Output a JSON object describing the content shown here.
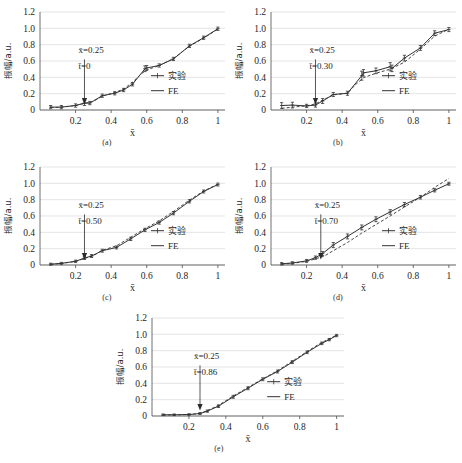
{
  "figure": {
    "panel_captions": [
      "(a)",
      "(b)",
      "(c)",
      "(d)",
      "(e)"
    ],
    "legend": {
      "experiment_label": "实验",
      "fe_label": "FE"
    },
    "axis": {
      "xlabel": "x̄",
      "ylabel": "振幅/a.u.",
      "xticks": [
        "0.2",
        "0.4",
        "0.6",
        "0.8",
        "1"
      ],
      "yticks": [
        "0",
        "0.2",
        "0.4",
        "0.6",
        "0.8",
        "1.0",
        "1.2"
      ]
    },
    "annotation_x": "x̄=0.25"
  },
  "chart_data": [
    {
      "type": "line",
      "panel": "(a)",
      "title": "",
      "xlabel": "x̄",
      "ylabel": "振幅/a.u.",
      "xlim": [
        0.0,
        1.04
      ],
      "ylim": [
        0.0,
        1.2
      ],
      "grid": true,
      "legend_position": "right-middle",
      "annotations": [
        "x̄=0.25",
        "t̄=0"
      ],
      "arrow_at_x": 0.25,
      "series": [
        {
          "name": "实验",
          "style": "solid-with-markers",
          "x": [
            0.06,
            0.12,
            0.2,
            0.25,
            0.28,
            0.35,
            0.42,
            0.47,
            0.52,
            0.59,
            0.6,
            0.67,
            0.75,
            0.84,
            0.92,
            1.0
          ],
          "y": [
            0.035,
            0.035,
            0.055,
            0.085,
            0.085,
            0.175,
            0.205,
            0.245,
            0.315,
            0.505,
            0.515,
            0.545,
            0.625,
            0.785,
            0.885,
            0.995
          ],
          "yerr": [
            0.02,
            0.02,
            0.02,
            0.03,
            0.02,
            0.02,
            0.02,
            0.02,
            0.02,
            0.035,
            0.03,
            0.02,
            0.02,
            0.02,
            0.02,
            0.02
          ]
        },
        {
          "name": "FE",
          "style": "dashed",
          "x": [
            0.06,
            0.12,
            0.2,
            0.25,
            0.3,
            0.35,
            0.42,
            0.47,
            0.52,
            0.57,
            0.6,
            0.67,
            0.75,
            0.84,
            0.92,
            1.0
          ],
          "y": [
            0.03,
            0.035,
            0.055,
            0.08,
            0.105,
            0.17,
            0.215,
            0.255,
            0.34,
            0.445,
            0.49,
            0.545,
            0.63,
            0.78,
            0.88,
            0.99
          ]
        }
      ]
    },
    {
      "type": "line",
      "panel": "(b)",
      "title": "",
      "xlabel": "x̄",
      "ylabel": "振幅/a.u.",
      "xlim": [
        0.0,
        1.04
      ],
      "ylim": [
        0.0,
        1.2
      ],
      "grid": true,
      "legend_position": "right-middle",
      "annotations": [
        "x̄=0.25",
        "t̄=0.30"
      ],
      "arrow_at_x": 0.25,
      "series": [
        {
          "name": "实验",
          "style": "solid-with-markers",
          "x": [
            0.06,
            0.12,
            0.2,
            0.25,
            0.29,
            0.35,
            0.43,
            0.51,
            0.52,
            0.59,
            0.67,
            0.68,
            0.75,
            0.84,
            0.92,
            1.0
          ],
          "y": [
            0.055,
            0.06,
            0.05,
            0.06,
            0.11,
            0.19,
            0.205,
            0.42,
            0.455,
            0.48,
            0.53,
            0.51,
            0.635,
            0.76,
            0.94,
            0.985
          ],
          "yerr": [
            0.035,
            0.035,
            0.02,
            0.025,
            0.03,
            0.025,
            0.025,
            0.055,
            0.04,
            0.035,
            0.05,
            0.04,
            0.035,
            0.03,
            0.03,
            0.025
          ]
        },
        {
          "name": "FE",
          "style": "dashed",
          "x": [
            0.06,
            0.12,
            0.2,
            0.25,
            0.3,
            0.35,
            0.43,
            0.47,
            0.52,
            0.59,
            0.67,
            0.75,
            0.84,
            0.92,
            1.0
          ],
          "y": [
            0.02,
            0.035,
            0.05,
            0.075,
            0.13,
            0.185,
            0.205,
            0.3,
            0.395,
            0.45,
            0.5,
            0.585,
            0.745,
            0.905,
            0.99
          ]
        }
      ]
    },
    {
      "type": "line",
      "panel": "(c)",
      "title": "",
      "xlabel": "x̄",
      "ylabel": "振幅/a.u.",
      "xlim": [
        0.0,
        1.04
      ],
      "ylim": [
        0.0,
        1.2
      ],
      "grid": true,
      "legend_position": "right-middle",
      "annotations": [
        "x̄=0.25",
        "t̄=0.50"
      ],
      "arrow_at_x": 0.25,
      "series": [
        {
          "name": "实验",
          "style": "solid-with-markers",
          "x": [
            0.06,
            0.12,
            0.2,
            0.25,
            0.29,
            0.35,
            0.43,
            0.51,
            0.59,
            0.67,
            0.75,
            0.84,
            0.92,
            1.0
          ],
          "y": [
            0.01,
            0.02,
            0.045,
            0.085,
            0.11,
            0.175,
            0.215,
            0.32,
            0.43,
            0.52,
            0.635,
            0.78,
            0.9,
            0.985
          ],
          "yerr": [
            0.012,
            0.012,
            0.015,
            0.018,
            0.018,
            0.018,
            0.018,
            0.02,
            0.02,
            0.02,
            0.02,
            0.02,
            0.018,
            0.018
          ]
        },
        {
          "name": "FE",
          "style": "dashed",
          "x": [
            0.06,
            0.12,
            0.2,
            0.25,
            0.3,
            0.35,
            0.43,
            0.51,
            0.59,
            0.67,
            0.75,
            0.84,
            0.92,
            1.0
          ],
          "y": [
            0.008,
            0.018,
            0.045,
            0.08,
            0.115,
            0.18,
            0.235,
            0.34,
            0.445,
            0.54,
            0.655,
            0.795,
            0.905,
            0.99
          ]
        }
      ]
    },
    {
      "type": "line",
      "panel": "(d)",
      "title": "",
      "xlabel": "x̄",
      "ylabel": "振幅/a.u.",
      "xlim": [
        0.0,
        1.04
      ],
      "ylim": [
        0.0,
        1.2
      ],
      "grid": true,
      "legend_position": "right-middle",
      "annotations": [
        "x̄=0.25",
        "t̄=0.70"
      ],
      "arrow_at_x": 0.28,
      "series": [
        {
          "name": "实验",
          "style": "solid-with-markers",
          "x": [
            0.06,
            0.12,
            0.2,
            0.25,
            0.29,
            0.35,
            0.43,
            0.51,
            0.59,
            0.67,
            0.75,
            0.84,
            0.92,
            1.0
          ],
          "y": [
            0.015,
            0.025,
            0.05,
            0.09,
            0.14,
            0.245,
            0.35,
            0.46,
            0.56,
            0.65,
            0.74,
            0.83,
            0.915,
            0.995
          ],
          "yerr": [
            0.015,
            0.015,
            0.018,
            0.02,
            0.025,
            0.03,
            0.03,
            0.03,
            0.03,
            0.028,
            0.025,
            0.022,
            0.02,
            0.018
          ]
        },
        {
          "name": "FE",
          "style": "dashed",
          "x": [
            0.06,
            0.12,
            0.2,
            0.25,
            0.3,
            0.35,
            0.43,
            0.51,
            0.59,
            0.67,
            0.75,
            0.84,
            0.92,
            1.0
          ],
          "y": [
            0.01,
            0.02,
            0.045,
            0.075,
            0.11,
            0.175,
            0.275,
            0.39,
            0.495,
            0.6,
            0.71,
            0.83,
            0.95,
            1.06
          ]
        }
      ]
    },
    {
      "type": "line",
      "panel": "(e)",
      "title": "",
      "xlabel": "x̄",
      "ylabel": "振幅/a.u.",
      "xlim": [
        0.0,
        1.04
      ],
      "ylim": [
        0.0,
        1.2
      ],
      "grid": true,
      "legend_position": "right-middle",
      "annotations": [
        "x̄=0.25",
        "t̄=0.86"
      ],
      "arrow_at_x": 0.26,
      "series": [
        {
          "name": "实验",
          "style": "solid-with-markers",
          "x": [
            0.06,
            0.12,
            0.2,
            0.26,
            0.3,
            0.36,
            0.44,
            0.52,
            0.6,
            0.68,
            0.76,
            0.84,
            0.92,
            0.96,
            1.0
          ],
          "y": [
            0.015,
            0.015,
            0.018,
            0.03,
            0.06,
            0.12,
            0.235,
            0.34,
            0.45,
            0.545,
            0.66,
            0.78,
            0.89,
            0.935,
            0.985
          ],
          "yerr": [
            0.01,
            0.01,
            0.01,
            0.012,
            0.014,
            0.016,
            0.018,
            0.018,
            0.018,
            0.018,
            0.018,
            0.016,
            0.016,
            0.014,
            0.014
          ]
        },
        {
          "name": "FE",
          "style": "dashed",
          "x": [
            0.06,
            0.12,
            0.2,
            0.26,
            0.3,
            0.36,
            0.44,
            0.52,
            0.6,
            0.68,
            0.76,
            0.84,
            0.92,
            1.0
          ],
          "y": [
            0.012,
            0.014,
            0.018,
            0.032,
            0.065,
            0.13,
            0.245,
            0.35,
            0.455,
            0.555,
            0.67,
            0.79,
            0.9,
            0.99
          ]
        }
      ]
    }
  ]
}
